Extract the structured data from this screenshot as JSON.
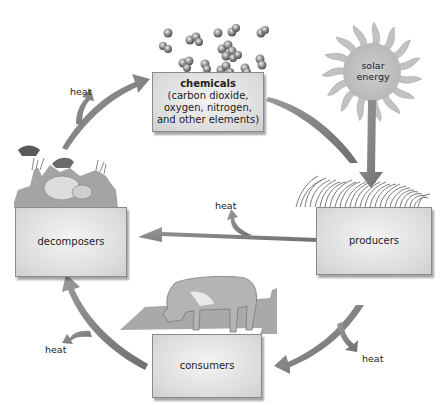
{
  "diagram": {
    "type": "cycle",
    "color_scheme": "grayscale",
    "nodes": {
      "chemicals": {
        "title": "chemicals",
        "lines": [
          "(carbon dioxide,",
          "oxygen, nitrogen,",
          "and other elements)"
        ]
      },
      "solar_energy": {
        "line1": "solar",
        "line2": "energy"
      },
      "producers": {
        "label": "producers"
      },
      "consumers": {
        "label": "consumers"
      },
      "decomposers": {
        "label": "decomposers"
      }
    },
    "heat_labels": {
      "top_left": "heat",
      "middle": "heat",
      "bottom_left": "heat",
      "bottom_right": "heat"
    },
    "flows": [
      {
        "from": "chemicals",
        "to": "producers"
      },
      {
        "from": "solar energy",
        "to": "producers"
      },
      {
        "from": "producers",
        "to": "decomposers"
      },
      {
        "from": "producers",
        "to": "consumers"
      },
      {
        "from": "consumers",
        "to": "decomposers"
      },
      {
        "from": "decomposers",
        "to": "chemicals"
      }
    ]
  }
}
